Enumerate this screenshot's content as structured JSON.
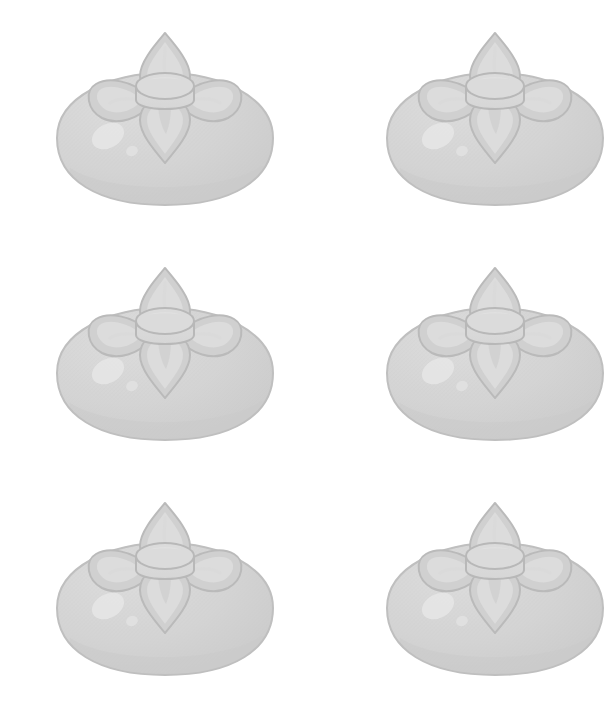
{
  "page": {
    "background_color": "#ffffff",
    "width": 519,
    "height": 705
  },
  "grid": {
    "columns": 2,
    "rows": 3,
    "item_count": 6,
    "item_name": "persimmon-fruit-illustration"
  },
  "palette": {
    "background": "#ffffff",
    "body_fill": "#d4d4d4",
    "body_fill_light": "#dcdcdc",
    "body_outline": "#bfbfbf",
    "body_shadow": "#cbcbcb",
    "highlight": "#e6e6e6",
    "highlight_soft": "#e2e2e2",
    "calyx_fill": "#d0d0d0",
    "calyx_fill_light": "#dddddd",
    "calyx_outline": "#bababa",
    "calyx_inner": "#d9d9d9",
    "cap_fill": "#d6d6d6",
    "cap_top_fill": "#dbdbdb",
    "cap_outline": "#b8b8b8",
    "texture": "#c9c9c9"
  },
  "fruit": {
    "name": "persimmon",
    "body": {
      "shape": "rounded-squat-sphere",
      "center_x": 125,
      "center_y": 120,
      "width": 215,
      "height": 132
    },
    "calyx": {
      "petal_count": 4,
      "petals": [
        {
          "position": "top",
          "name": "calyx-petal-top"
        },
        {
          "position": "left",
          "name": "calyx-petal-left"
        },
        {
          "position": "right",
          "name": "calyx-petal-right"
        },
        {
          "position": "bottom",
          "name": "calyx-petal-bottom"
        }
      ]
    },
    "stem_cap": {
      "shape": "cylinder",
      "name": "stem-cap"
    },
    "highlights": [
      {
        "name": "highlight-large",
        "cx": 68,
        "cy": 118,
        "rx": 17,
        "ry": 12,
        "rotate": -28
      },
      {
        "name": "highlight-small",
        "cx": 92,
        "cy": 133,
        "rx": 6,
        "ry": 5,
        "rotate": -20
      }
    ]
  },
  "items": [
    {
      "id": 1,
      "row": 1,
      "column": 1,
      "label": "persimmon-1"
    },
    {
      "id": 2,
      "row": 1,
      "column": 2,
      "label": "persimmon-2"
    },
    {
      "id": 3,
      "row": 2,
      "column": 1,
      "label": "persimmon-3"
    },
    {
      "id": 4,
      "row": 2,
      "column": 2,
      "label": "persimmon-4"
    },
    {
      "id": 5,
      "row": 3,
      "column": 1,
      "label": "persimmon-5"
    },
    {
      "id": 6,
      "row": 3,
      "column": 2,
      "label": "persimmon-6"
    }
  ]
}
